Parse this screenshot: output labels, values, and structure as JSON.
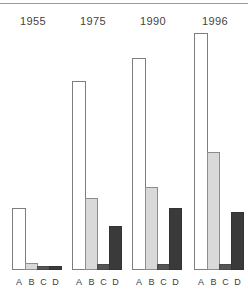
{
  "chart_data": {
    "type": "bar",
    "title": "",
    "subtitle": "",
    "xlabel": "",
    "ylabel": "",
    "grid": false,
    "legend_position": "none",
    "orientation": "vertical",
    "axis_ranges": {
      "ylim": [
        0,
        100
      ]
    },
    "categories": [
      "1955",
      "1975",
      "1990",
      "1996"
    ],
    "tick_labels": [
      "A",
      "B",
      "C",
      "D"
    ],
    "series": [
      {
        "name": "A",
        "color": "#ffffff",
        "edge_color": "#7d7d7d",
        "values": [
          26,
          79,
          89,
          100
        ]
      },
      {
        "name": "B",
        "color": "#d9d9d9",
        "edge_color": "#8d8d8d",
        "values": [
          3,
          30,
          35,
          50
        ]
      },
      {
        "name": "C",
        "color": "#555555",
        "edge_color": "#4a4a4a",
        "values": [
          2,
          3,
          3,
          3
        ]
      },
      {
        "name": "D",
        "color": "#3a3a3a",
        "edge_color": "#333333",
        "values": [
          2,
          18,
          26,
          24
        ]
      }
    ],
    "groups": [
      {
        "label": "1955",
        "bars": [
          {
            "series": "A",
            "value": 26,
            "bar_height_px": 62,
            "left_px": 2,
            "width_px": 14
          },
          {
            "series": "B",
            "value": 3,
            "bar_height_px": 7,
            "left_px": 15,
            "width_px": 13
          },
          {
            "series": "C",
            "value": 2,
            "bar_height_px": 4,
            "left_px": 27,
            "width_px": 13
          },
          {
            "series": "D",
            "value": 2,
            "bar_height_px": 4,
            "left_px": 39,
            "width_px": 13
          }
        ]
      },
      {
        "label": "1975",
        "bars": [
          {
            "series": "A",
            "value": 79,
            "bar_height_px": 189,
            "left_px": 2,
            "width_px": 14
          },
          {
            "series": "B",
            "value": 30,
            "bar_height_px": 72,
            "left_px": 15,
            "width_px": 13
          },
          {
            "series": "C",
            "value": 3,
            "bar_height_px": 6,
            "left_px": 27,
            "width_px": 13
          },
          {
            "series": "D",
            "value": 18,
            "bar_height_px": 44,
            "left_px": 39,
            "width_px": 13
          }
        ]
      },
      {
        "label": "1990",
        "bars": [
          {
            "series": "A",
            "value": 89,
            "bar_height_px": 212,
            "left_px": 2,
            "width_px": 14
          },
          {
            "series": "B",
            "value": 35,
            "bar_height_px": 83,
            "left_px": 15,
            "width_px": 13
          },
          {
            "series": "C",
            "value": 3,
            "bar_height_px": 6,
            "left_px": 27,
            "width_px": 13
          },
          {
            "series": "D",
            "value": 26,
            "bar_height_px": 62,
            "left_px": 39,
            "width_px": 13
          }
        ]
      },
      {
        "label": "1996",
        "bars": [
          {
            "series": "A",
            "value": 100,
            "bar_height_px": 237,
            "left_px": 2,
            "width_px": 14
          },
          {
            "series": "B",
            "value": 50,
            "bar_height_px": 118,
            "left_px": 15,
            "width_px": 13
          },
          {
            "series": "C",
            "value": 3,
            "bar_height_px": 6,
            "left_px": 27,
            "width_px": 13
          },
          {
            "series": "D",
            "value": 24,
            "bar_height_px": 58,
            "left_px": 39,
            "width_px": 13
          }
        ]
      }
    ]
  },
  "layout": {
    "group_left_px": [
      4,
      64,
      124,
      186
    ],
    "rule_color": "#9a9a9a",
    "background": "#ffffff",
    "title_color": "#444444",
    "tick_color": "#3c3c3c"
  }
}
